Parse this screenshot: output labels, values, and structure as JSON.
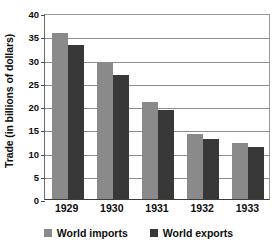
{
  "chart_data": {
    "type": "bar",
    "title": "",
    "xlabel": "",
    "ylabel": "Trade (in billions of dollars)",
    "categories": [
      "1929",
      "1930",
      "1931",
      "1932",
      "1933"
    ],
    "series": [
      {
        "name": "World imports",
        "color": "#8a8a8a",
        "values": [
          35.6,
          29.3,
          20.9,
          14.0,
          12.0
        ]
      },
      {
        "name": "World exports",
        "color": "#383838",
        "values": [
          33.1,
          26.6,
          19.1,
          12.8,
          11.1
        ]
      }
    ],
    "ylim": [
      0,
      40
    ],
    "yticks": [
      0,
      5,
      10,
      15,
      20,
      25,
      30,
      35,
      40
    ],
    "ytick_labels": [
      "0",
      "5",
      "10",
      "15",
      "20",
      "25",
      "30",
      "35",
      "40"
    ],
    "grid": true,
    "legend_position": "bottom",
    "background_color": "#ffffff",
    "gridline_color": "#8d8d8d",
    "axis_color": "#3c3c3c"
  }
}
